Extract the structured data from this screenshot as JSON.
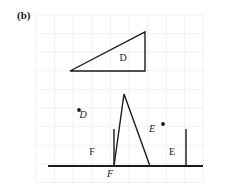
{
  "panel": {
    "label": "(b)"
  },
  "colors": {
    "ink": "#1a1a1a",
    "grid": "#f0f0f2",
    "background": "#ffffff"
  },
  "grid": {
    "visible": true,
    "spacing": 18.6,
    "x_start": 36,
    "y_start": 15,
    "columns": 9,
    "rows": 9,
    "left": 36,
    "right": 203,
    "top": 15,
    "bottom": 182
  },
  "figures": {
    "upper_triangle": {
      "label": "D",
      "label_x": 123,
      "label_y": 61,
      "points": "70,71 145,71 145,32",
      "vertices": [
        {
          "x": 70,
          "y": 71
        },
        {
          "x": 145,
          "y": 71
        },
        {
          "x": 145,
          "y": 32
        }
      ]
    },
    "lower_left_triangle": {
      "label": "F",
      "label_x": 92,
      "label_y": 155,
      "points": "48,166 114,166 114,129",
      "vertices": [
        {
          "x": 48,
          "y": 166
        },
        {
          "x": 114,
          "y": 166
        },
        {
          "x": 114,
          "y": 129
        }
      ]
    },
    "lower_right_triangle": {
      "label": "E",
      "label_x": 172,
      "label_y": 155,
      "points": "130,166 186,166 186,129",
      "vertices": [
        {
          "x": 130,
          "y": 166
        },
        {
          "x": 186,
          "y": 166
        },
        {
          "x": 186,
          "y": 129
        }
      ]
    },
    "tall_triangle": {
      "points": "124,94 114,166 150,166",
      "vertices": [
        {
          "x": 124,
          "y": 94
        },
        {
          "x": 114,
          "y": 166
        },
        {
          "x": 150,
          "y": 166
        }
      ]
    },
    "baseline": {
      "x1": 48,
      "y1": 166,
      "x2": 203,
      "y2": 166
    }
  },
  "markers": {
    "point_d": {
      "label": "D",
      "dot_x": 79,
      "dot_y": 110,
      "label_x": 83,
      "label_y": 118
    },
    "point_e": {
      "label": "E",
      "dot_x": 163,
      "dot_y": 124,
      "label_x": 152,
      "label_y": 132
    },
    "point_f": {
      "label": "F",
      "label_x": 110,
      "label_y": 177
    }
  }
}
